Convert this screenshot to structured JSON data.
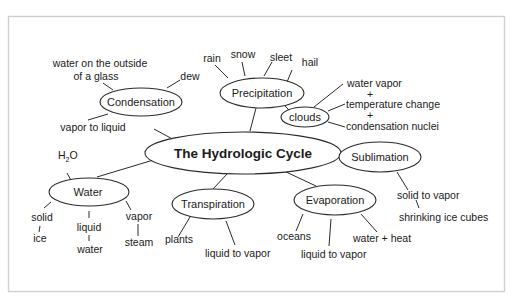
{
  "diagram": {
    "title": "The Hydrologic Cycle",
    "nodes": {
      "condensation": {
        "label": "Condensation",
        "details": [
          "water on the outside",
          "of a glass",
          "dew",
          "vapor to liquid"
        ]
      },
      "precipitation": {
        "label": "Precipitation",
        "details": [
          "rain",
          "snow",
          "sleet",
          "hail"
        ]
      },
      "clouds": {
        "label": "clouds",
        "details": [
          "water vapor",
          "+",
          "temperature change",
          "+",
          "condensation nuclei"
        ]
      },
      "sublimation": {
        "label": "Sublimation",
        "details": [
          "solid to vapor",
          "shrinking ice cubes"
        ]
      },
      "water": {
        "label": "Water",
        "formula_main": "H",
        "formula_sub": "2",
        "formula_end": "O",
        "details": [
          "solid",
          "ice",
          "liquid",
          "water",
          "vapor",
          "steam"
        ]
      },
      "transpiration": {
        "label": "Transpiration",
        "details": [
          "plants",
          "liquid to vapor"
        ]
      },
      "evaporation": {
        "label": "Evaporation",
        "details": [
          "oceans",
          "liquid to vapor",
          "water + heat"
        ]
      }
    }
  }
}
